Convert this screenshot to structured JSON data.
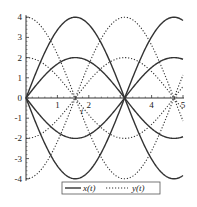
{
  "chart_data": {
    "type": "line",
    "title": "",
    "xlabel": "t",
    "ylabel": "",
    "xlim": [
      0,
      5
    ],
    "ylim": [
      -4,
      4
    ],
    "grid": false,
    "legend_position": "bottom",
    "xticks": [
      1,
      2,
      4,
      5
    ],
    "yticks": [
      -4,
      -3,
      -2,
      -1,
      0,
      1,
      2,
      3,
      4
    ],
    "x_tick_labels": [
      "1",
      "2",
      "4",
      "5"
    ],
    "y_tick_labels": [
      "-4",
      "-3",
      "-2",
      "-1",
      "0",
      "1",
      "2",
      "3",
      "4"
    ],
    "legend": [
      "x(t)",
      "y(t)"
    ],
    "series": [
      {
        "name": "x(t)",
        "style": "solid",
        "formula": "4 sin(t)",
        "amplitude": 4,
        "func": "sin"
      },
      {
        "name": "x(t)",
        "style": "solid",
        "formula": "2 sin(t)",
        "amplitude": 2,
        "func": "sin"
      },
      {
        "name": "x(t)",
        "style": "solid",
        "formula": "-2 sin(t)",
        "amplitude": -2,
        "func": "sin"
      },
      {
        "name": "x(t)",
        "style": "solid",
        "formula": "-4 sin(t)",
        "amplitude": -4,
        "func": "sin"
      },
      {
        "name": "y(t)",
        "style": "dotted",
        "formula": "4 cos(t)",
        "amplitude": 4,
        "func": "cos"
      },
      {
        "name": "y(t)",
        "style": "dotted",
        "formula": "2 cos(t)",
        "amplitude": 2,
        "func": "cos"
      },
      {
        "name": "y(t)",
        "style": "dotted",
        "formula": "-2 cos(t)",
        "amplitude": -2,
        "func": "cos"
      },
      {
        "name": "y(t)",
        "style": "dotted",
        "formula": "-4 cos(t)",
        "amplitude": -4,
        "func": "cos"
      }
    ],
    "sample_points": {
      "t": [
        0,
        0.5,
        1,
        1.5,
        2,
        2.5,
        3,
        3.5,
        4,
        4.5,
        5
      ],
      "4sin": [
        0,
        1.92,
        3.37,
        3.99,
        3.64,
        2.39,
        0.56,
        -1.4,
        -3.03,
        -3.91,
        -3.84
      ],
      "2sin": [
        0,
        0.96,
        1.68,
        2.0,
        1.82,
        1.2,
        0.28,
        -0.7,
        -1.51,
        -1.96,
        -1.92
      ],
      "4cos": [
        4,
        3.51,
        2.16,
        0.28,
        -1.66,
        -3.2,
        -3.96,
        -3.75,
        -2.61,
        -0.84,
        1.13
      ],
      "2cos": [
        2,
        1.76,
        1.08,
        0.14,
        -0.83,
        -1.6,
        -1.98,
        -1.87,
        -1.31,
        -0.42,
        0.57
      ]
    },
    "colors": {
      "line": "#333333",
      "axis": "#333333"
    }
  }
}
